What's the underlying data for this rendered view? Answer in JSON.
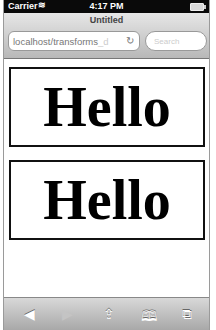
{
  "status_bar": {
    "carrier": "Carrier",
    "wifi_icon": "wifi-icon",
    "time": "4:17 PM",
    "battery_icon": "battery-icon"
  },
  "browser": {
    "title": "Untitled",
    "url": "localhost/transforms",
    "url_fade": "_d",
    "reload_icon": "↻",
    "search_placeholder": "Search"
  },
  "content": {
    "boxes": [
      {
        "text": "Hello"
      },
      {
        "text": "Hello"
      }
    ]
  },
  "toolbar": {
    "back": "◀",
    "forward": "▶",
    "share": "⇪",
    "bookmarks": "🕮",
    "tabs": "⧉"
  }
}
